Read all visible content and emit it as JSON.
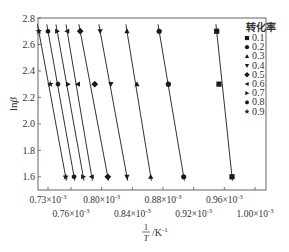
{
  "chart_data": {
    "type": "scatter",
    "title": "",
    "xlabel": "1/T /K^-1",
    "xlabel_parts": {
      "numerator": "1",
      "denominator": "T",
      "unit": "/K",
      "unit_exp": "-1"
    },
    "ylabel": "lnβ",
    "ylabel_parts": {
      "base": "ln",
      "symbol": "β"
    },
    "xlim": [
      0.72,
      1.02
    ],
    "ylim": [
      1.5,
      2.8
    ],
    "y_ticks": [
      1.6,
      1.8,
      2.0,
      2.2,
      2.4,
      2.6,
      2.8
    ],
    "y_tick_labels": [
      "1.6",
      "1.8",
      "2.0",
      "2.2",
      "2.4",
      "2.6",
      "2.8"
    ],
    "x_tick_labels_top_row": [
      "0.73×10",
      "0.80×10",
      "0.88×10",
      "0.96×10"
    ],
    "x_tick_labels_bottom_row": [
      "0.76×10",
      "0.84×10",
      "0.92×10",
      "1.00×10"
    ],
    "x_tick_exponent": "-3",
    "x_tick_values": [
      0.73,
      0.76,
      0.8,
      0.84,
      0.88,
      0.92,
      0.96,
      1.0
    ],
    "grid": false,
    "legend_position": "upper right (inside)",
    "legend_title": "转化率",
    "series": [
      {
        "name": "0.1",
        "marker": "square",
        "x": [
          0.95,
          0.953,
          0.97
        ],
        "y": [
          2.7,
          2.3,
          1.6
        ]
      },
      {
        "name": "0.2",
        "marker": "circle",
        "x": [
          0.875,
          0.887,
          0.907
        ],
        "y": [
          2.7,
          2.3,
          1.6
        ]
      },
      {
        "name": "0.3",
        "marker": "triangle-up",
        "x": [
          0.833,
          0.846,
          0.864
        ],
        "y": [
          2.7,
          2.3,
          1.6
        ]
      },
      {
        "name": "0.4",
        "marker": "triangle-down",
        "x": [
          0.798,
          0.812,
          0.833
        ],
        "y": [
          2.7,
          2.3,
          1.6
        ]
      },
      {
        "name": "0.5",
        "marker": "diamond",
        "x": [
          0.772,
          0.791,
          0.808
        ],
        "y": [
          2.7,
          2.3,
          1.6
        ]
      },
      {
        "name": "0.6",
        "marker": "triangle-left",
        "x": [
          0.755,
          0.769,
          0.787
        ],
        "y": [
          2.7,
          2.3,
          1.6
        ]
      },
      {
        "name": "0.7",
        "marker": "triangle-right",
        "x": [
          0.742,
          0.756,
          0.776
        ],
        "y": [
          2.7,
          2.3,
          1.6
        ]
      },
      {
        "name": "0.8",
        "marker": "hexagon",
        "x": [
          0.73,
          0.743,
          0.764
        ],
        "y": [
          2.7,
          2.3,
          1.6
        ]
      },
      {
        "name": "0.9",
        "marker": "star",
        "x": [
          0.718,
          0.733,
          0.753
        ],
        "y": [
          2.7,
          2.3,
          1.6
        ]
      }
    ],
    "fit_lines": true,
    "colors": {
      "axis": "#555555",
      "marker": "#1a1a1a",
      "line": "#1a1a1a",
      "text": "#333333"
    }
  }
}
